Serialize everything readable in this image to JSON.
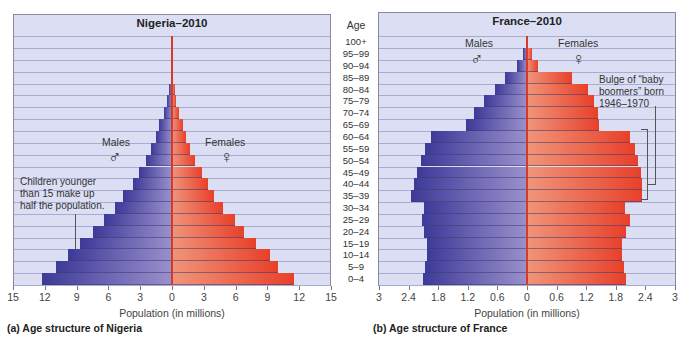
{
  "page_header_fragment": "",
  "chart_data": [
    {
      "type": "bar",
      "orientation": "horizontal-pyramid",
      "title": "Nigeria–2010",
      "caption": "(a) Age structure of Nigeria",
      "xlabel": "Population (in millions)",
      "ylabel": "Age",
      "xlim": [
        -15,
        15
      ],
      "x_ticks": [
        "15",
        "12",
        "9",
        "6",
        "3",
        "0",
        "3",
        "6",
        "9",
        "12",
        "15"
      ],
      "categories": [
        "0–4",
        "5–9",
        "10–14",
        "15–19",
        "20–24",
        "25–29",
        "30–34",
        "35–39",
        "40–44",
        "45–49",
        "50–54",
        "55–59",
        "60–64",
        "65–69",
        "70–74",
        "75–79",
        "80–84",
        "85–89",
        "90–94",
        "95–99",
        "100+"
      ],
      "series": [
        {
          "name": "Males",
          "color": "#3d3a98",
          "values": [
            12.3,
            10.9,
            9.8,
            8.7,
            7.5,
            6.4,
            5.4,
            4.6,
            3.7,
            3.1,
            2.5,
            2.0,
            1.5,
            1.2,
            0.8,
            0.5,
            0.3,
            0.1,
            0.05,
            0.02,
            0.01
          ]
        },
        {
          "name": "Females",
          "color": "#e8402a",
          "values": [
            11.5,
            10.0,
            9.2,
            7.9,
            6.8,
            5.9,
            4.8,
            4.0,
            3.4,
            2.8,
            2.2,
            1.7,
            1.3,
            1.0,
            0.7,
            0.4,
            0.3,
            0.1,
            0.05,
            0.02,
            0.01
          ]
        }
      ],
      "legend": {
        "males": "Males",
        "females": "Females",
        "male_symbol": "♂",
        "female_symbol": "♀"
      },
      "annotation": "Children younger than 15 make up half the population.",
      "annotation_lines": [
        "Children younger",
        "than 15 make up",
        "half the population."
      ],
      "grid": true
    },
    {
      "type": "bar",
      "orientation": "horizontal-pyramid",
      "title": "France–2010",
      "caption": "(b) Age structure of France",
      "xlabel": "Population (in millions)",
      "ylabel": "Age",
      "xlim": [
        -3,
        3
      ],
      "x_ticks": [
        "3",
        "2.4",
        "1.8",
        "1.2",
        "0.6",
        "0",
        "0.6",
        "1.2",
        "1.8",
        "2.4",
        "3"
      ],
      "categories": [
        "0–4",
        "5–9",
        "10–14",
        "15–19",
        "20–24",
        "25–29",
        "30–34",
        "35–39",
        "40–44",
        "45–49",
        "50–54",
        "55–59",
        "60–64",
        "65–69",
        "70–74",
        "75–79",
        "80–84",
        "85–89",
        "90–94",
        "95–99",
        "100+"
      ],
      "series": [
        {
          "name": "Males",
          "color": "#3d3a98",
          "values": [
            2.1,
            2.06,
            2.02,
            2.02,
            2.08,
            2.12,
            2.08,
            2.35,
            2.29,
            2.22,
            2.14,
            2.07,
            1.95,
            1.23,
            1.07,
            0.87,
            0.65,
            0.44,
            0.2,
            0.08,
            0.02
          ]
        },
        {
          "name": "Females",
          "color": "#e8402a",
          "values": [
            2.0,
            1.97,
            1.93,
            1.93,
            2.01,
            2.09,
            1.99,
            2.33,
            2.33,
            2.31,
            2.24,
            2.19,
            2.08,
            1.46,
            1.43,
            1.36,
            1.24,
            0.92,
            0.23,
            0.11,
            0.03
          ]
        }
      ],
      "legend": {
        "males": "Males",
        "females": "Females",
        "male_symbol": "♂",
        "female_symbol": "♀"
      },
      "annotation": "Bulge of “baby boomers” born 1946–1970",
      "annotation_lines": [
        "Bulge of “baby",
        "boomers” born",
        "1946–1970"
      ],
      "grid": true
    }
  ],
  "age_axis": {
    "header": "Age",
    "labels_top_down": [
      "100+",
      "95–99",
      "90–94",
      "85–89",
      "80–84",
      "75–79",
      "70–74",
      "65–69",
      "60–64",
      "55–59",
      "50–54",
      "45–49",
      "40–44",
      "35–39",
      "30–34",
      "25–29",
      "20–24",
      "15–19",
      "10–14",
      "5–9",
      "0–4"
    ]
  }
}
